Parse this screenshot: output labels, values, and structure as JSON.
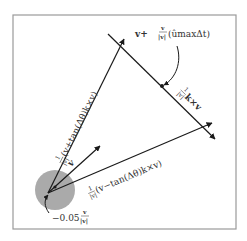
{
  "diagram": {
    "frame": {
      "x": 13,
      "y": 15,
      "width": 223,
      "height": 214
    },
    "colors": {
      "circle_fill": "#aaaaaa",
      "line": "#1a1a1a",
      "frame": "#9a9a9a",
      "text": "#333333"
    },
    "origin": {
      "x": 48,
      "y": 193
    },
    "circle": {
      "cx": 55,
      "cy": 190,
      "r": 20
    },
    "labels": {
      "top_right": {
        "main": "v+",
        "frac_num": "v",
        "frac_den": "|v|",
        "tail": "(ûmaxΔt)"
      },
      "perp": {
        "frac_num": "1",
        "frac_den": "|v|",
        "tail": "k×v"
      },
      "upper_vector": {
        "frac_num": "1",
        "frac_den": "|v|",
        "tail": "(v+tan(Δθ)k×v)"
      },
      "lower_vector": {
        "frac_num": "1",
        "frac_den": "|v|",
        "tail": "(v−tan(Δθ)k×v)"
      },
      "v": "v",
      "offset": {
        "main": "−0.05",
        "frac_num": "v",
        "frac_den": "|v|"
      }
    }
  }
}
